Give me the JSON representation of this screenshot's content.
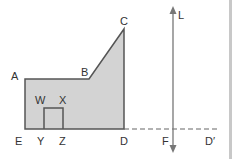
{
  "diagram": {
    "colors": {
      "fill": "#d3d3d3",
      "stroke": "#555555",
      "line": "#777777",
      "right_border": "#c8c8c8"
    },
    "points": {
      "A": "A",
      "B": "B",
      "C": "C",
      "D": "D",
      "E": "E",
      "W": "W",
      "X": "X",
      "Y": "Y",
      "Z": "Z",
      "F": "F",
      "D_prime": "D′",
      "L": "L"
    }
  }
}
